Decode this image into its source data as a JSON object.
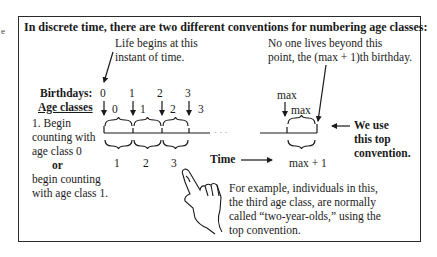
{
  "title": "In discrete time, there are two different conventions for numbering age classes:",
  "edge_mark": "e",
  "annotations": {
    "life_begins": [
      "Life begins at this",
      "instant of time."
    ],
    "no_one_lives": [
      "No one lives beyond this",
      "point, the (max + 1)th birthday."
    ],
    "we_use": [
      "We use",
      "this top",
      "convention."
    ],
    "example": [
      "For example, individuals in this,",
      "the third age class, are normally",
      "called “two-year-olds,” using the",
      "top convention."
    ]
  },
  "labels": {
    "birthdays": "Birthdays:",
    "age_classes": "Age classes",
    "time": "Time",
    "ellipsis": "· · ·",
    "max_birthday": "max",
    "max_class": "max",
    "max_plus_one": "max + 1"
  },
  "left_text": {
    "line1": "1. Begin",
    "line2": "counting with",
    "line3": "age class 0",
    "or": "or",
    "line4": "begin counting",
    "line5": "with age class 1."
  },
  "birthdays": [
    "0",
    "1",
    "2",
    "3"
  ],
  "top_age_classes": [
    "0",
    "1",
    "2",
    "3"
  ],
  "bottom_age_classes": [
    "1",
    "2",
    "3"
  ]
}
